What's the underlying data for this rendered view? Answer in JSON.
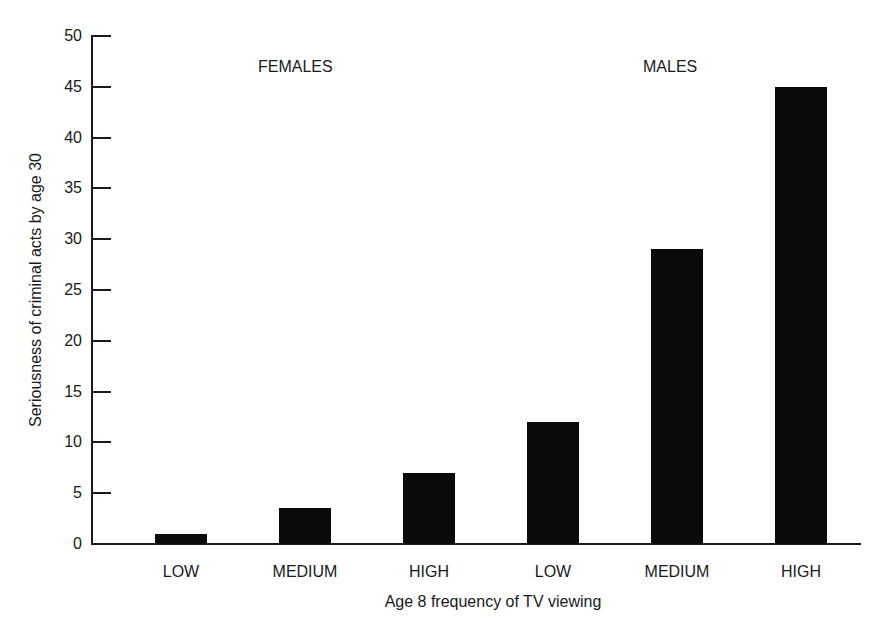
{
  "chart_data": {
    "type": "bar",
    "title": "",
    "xlabel": "Age 8 frequency of TV viewing",
    "ylabel": "Seriousness of criminal acts by age 30",
    "ylim": [
      0,
      50
    ],
    "yticks": [
      "0",
      "5",
      "10",
      "15",
      "20",
      "25",
      "30",
      "35",
      "40",
      "45",
      "50"
    ],
    "grid": false,
    "groups": [
      {
        "name": "FEMALES",
        "categories": [
          "LOW",
          "MEDIUM",
          "HIGH"
        ],
        "values": [
          1,
          3.5,
          7
        ]
      },
      {
        "name": "MALES",
        "categories": [
          "LOW",
          "MEDIUM",
          "HIGH"
        ],
        "values": [
          12,
          29,
          45
        ]
      }
    ],
    "categories": [
      "LOW",
      "MEDIUM",
      "HIGH",
      "LOW",
      "MEDIUM",
      "HIGH"
    ],
    "values": [
      1,
      3.5,
      7,
      12,
      29,
      45
    ],
    "annotations": [
      "FEMALES",
      "MALES"
    ],
    "bar_color": "#0a0a0a"
  }
}
